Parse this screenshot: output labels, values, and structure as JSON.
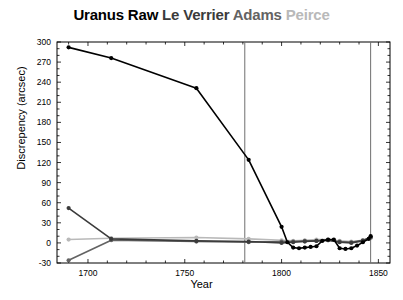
{
  "chart_data": {
    "type": "line",
    "title": "Uranus Raw Le Verrier Adams Peirce",
    "title_segments": [
      {
        "text": "Uranus Raw",
        "color": "#000000",
        "name": "uranus-raw"
      },
      {
        "text": " Le Verrier",
        "color": "#3b3b3b",
        "name": "le-verrier"
      },
      {
        "text": " Adams",
        "color": "#636363",
        "name": "adams"
      },
      {
        "text": " Peirce",
        "color": "#b9b9b9",
        "name": "peirce"
      }
    ],
    "xlabel": "Year",
    "ylabel": "Discrepency (arcsec)",
    "xlim": [
      1684,
      1856
    ],
    "ylim": [
      -30,
      300
    ],
    "xticks": [
      1700,
      1750,
      1800,
      1850
    ],
    "xtick_labels": [
      "1700",
      "1750",
      "1800",
      "1850"
    ],
    "yticks": [
      -30,
      0,
      30,
      60,
      90,
      120,
      150,
      180,
      210,
      240,
      270,
      300
    ],
    "ytick_labels": [
      "-30",
      "0",
      "30",
      "60",
      "90",
      "120",
      "150",
      "180",
      "210",
      "240",
      "270",
      "300"
    ],
    "grid": false,
    "legend": "in-title",
    "vlines": [
      {
        "x": 1781,
        "label": "uranus-discovery",
        "color": "#6e6e6e"
      },
      {
        "x": 1846,
        "label": "neptune-discovery",
        "color": "#6e6e6e"
      }
    ],
    "series": [
      {
        "name": "Uranus Raw",
        "color": "#000000",
        "marker": "circle",
        "x": [
          1690,
          1712,
          1756,
          1783,
          1800,
          1803,
          1806,
          1809,
          1812,
          1815,
          1818,
          1821,
          1824,
          1827,
          1830,
          1833,
          1836,
          1839,
          1842,
          1845,
          1846
        ],
        "y": [
          292,
          276,
          231,
          124,
          24,
          1,
          -7,
          -8,
          -7,
          -6,
          -5,
          3,
          5,
          5,
          -8,
          -9,
          -8,
          -4,
          1,
          6,
          10
        ]
      },
      {
        "name": "Le Verrier",
        "color": "#3b3b3b",
        "marker": "circle",
        "x": [
          1690,
          1712,
          1756,
          1783,
          1800,
          1806,
          1812,
          1818,
          1824,
          1830,
          1836,
          1842,
          1846
        ],
        "y": [
          52,
          6,
          3,
          2,
          0,
          1,
          2,
          3,
          4,
          1,
          0,
          3,
          9
        ]
      },
      {
        "name": "Adams",
        "color": "#636363",
        "marker": "circle",
        "x": [
          1690,
          1712,
          1756,
          1783,
          1800,
          1806,
          1812,
          1818,
          1824,
          1830,
          1836,
          1842,
          1846
        ],
        "y": [
          -26,
          4,
          2,
          1,
          2,
          2,
          3,
          3,
          4,
          2,
          1,
          4,
          8
        ]
      },
      {
        "name": "Peirce",
        "color": "#b9b9b9",
        "marker": "circle",
        "x": [
          1690,
          1712,
          1756,
          1783,
          1800,
          1806,
          1812,
          1818,
          1824,
          1830,
          1836,
          1842,
          1846
        ],
        "y": [
          5,
          7,
          8,
          6,
          4,
          3,
          4,
          5,
          5,
          3,
          2,
          4,
          7
        ]
      }
    ]
  }
}
